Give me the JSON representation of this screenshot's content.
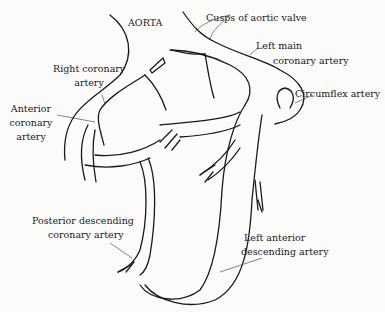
{
  "diagram": {
    "labels": {
      "aorta": "AORTA",
      "cusps": "Cusps of aortic valve",
      "left_main_1": "Left main",
      "left_main_2": "coronary artery",
      "right_coronary_1": "Right coronary",
      "right_coronary_2": "artery",
      "anterior_1": "Anterior",
      "anterior_2": "coronary",
      "anterior_3": "artery",
      "circumflex": "Circumflex artery",
      "posterior_1": "Posterior descending",
      "posterior_2": "coronary artery",
      "lad_1": "Left anterior",
      "lad_2": "descending artery"
    },
    "colors": {
      "ink": "#1a1a1a",
      "background": "#fbfbfa"
    }
  }
}
